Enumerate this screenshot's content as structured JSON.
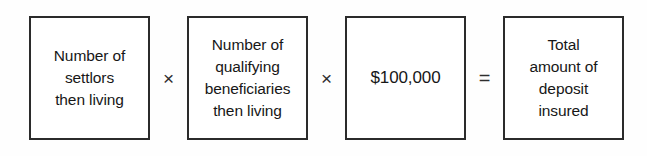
{
  "diagram": {
    "type": "formula-equation",
    "background_color": "#fefefe",
    "border_color": "#2b2b2b",
    "text_color": "#171717",
    "terms": [
      {
        "id": "settlors",
        "lines": [
          "Number of",
          "settlors",
          "then living"
        ]
      },
      {
        "id": "beneficiaries",
        "lines": [
          "Number of",
          "qualifying",
          "beneficiaries",
          "then living"
        ]
      },
      {
        "id": "amount",
        "lines": [
          "$100,000"
        ]
      },
      {
        "id": "result",
        "lines": [
          "Total",
          "amount of",
          "deposit",
          "insured"
        ]
      }
    ],
    "operators": [
      {
        "id": "multiply-1",
        "symbol": "×",
        "name": "multiplication-sign"
      },
      {
        "id": "multiply-2",
        "symbol": "×",
        "name": "multiplication-sign"
      },
      {
        "id": "equals",
        "symbol": "=",
        "name": "equals-sign"
      }
    ]
  }
}
